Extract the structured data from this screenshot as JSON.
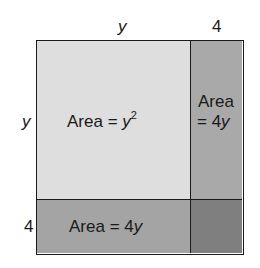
{
  "diagram": {
    "top_labels": {
      "left": "y",
      "right": "4"
    },
    "side_labels": {
      "top": "y",
      "bottom": "4"
    },
    "regions": {
      "big_square": {
        "prefix": "Area = ",
        "var": "y",
        "exponent": "2",
        "fill": "#dedede"
      },
      "right_strip": {
        "line1": "Area",
        "line2_prefix": "= 4",
        "line2_var": "y",
        "fill": "#a9a9a9"
      },
      "bottom_strip": {
        "prefix": "Area = 4",
        "var": "y",
        "fill": "#a4a4a4"
      },
      "corner": {
        "fill": "#7f7f7f"
      }
    }
  }
}
